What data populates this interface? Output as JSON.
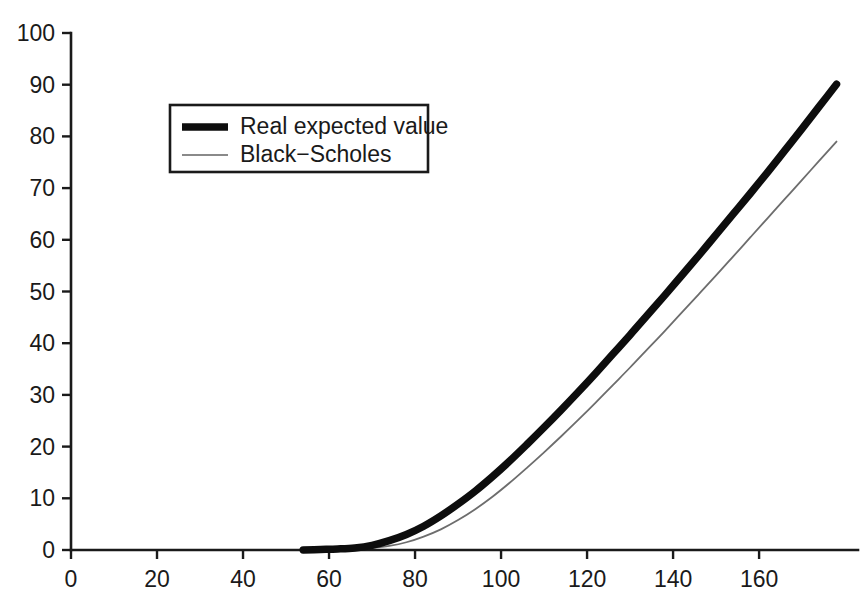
{
  "chart_data": {
    "type": "line",
    "title": "",
    "xlabel": "",
    "ylabel": "",
    "xlim": [
      0,
      183
    ],
    "ylim": [
      0,
      100
    ],
    "grid": false,
    "legend_position": "upper-left-inside",
    "xticks": [
      0,
      20,
      40,
      60,
      80,
      100,
      120,
      140,
      160
    ],
    "yticks": [
      0,
      10,
      20,
      30,
      40,
      50,
      60,
      70,
      80,
      90,
      100
    ],
    "xtick_labels": [
      "0",
      "20",
      "40",
      "60",
      "80",
      "100",
      "120",
      "140",
      "160"
    ],
    "ytick_labels": [
      "0",
      "10",
      "20",
      "30",
      "40",
      "50",
      "60",
      "70",
      "80",
      "90",
      "100"
    ],
    "series": [
      {
        "name": "Real expected value",
        "style": "thick-black",
        "color": "#0d0d0d",
        "linewidth": 7.5,
        "x": [
          54,
          58,
          62,
          66,
          70,
          74,
          78,
          82,
          86,
          90,
          94,
          98,
          102,
          106,
          110,
          114,
          118,
          122,
          126,
          130,
          134,
          138,
          142,
          146,
          150,
          154,
          158,
          162,
          166,
          170,
          174,
          178
        ],
        "y": [
          0.0,
          0.1,
          0.2,
          0.4,
          0.9,
          1.8,
          3.0,
          4.6,
          6.6,
          8.9,
          11.4,
          14.2,
          17.2,
          20.4,
          23.7,
          27.1,
          30.6,
          34.2,
          37.9,
          41.6,
          45.4,
          49.2,
          53.1,
          57.0,
          61.0,
          65.0,
          69.0,
          73.1,
          77.3,
          81.5,
          85.8,
          90.1
        ]
      },
      {
        "name": "Black−Scholes",
        "style": "thin-gray",
        "color": "#6d6d6d",
        "linewidth": 1.8,
        "x": [
          54,
          58,
          62,
          66,
          70,
          74,
          78,
          82,
          86,
          90,
          94,
          98,
          102,
          106,
          110,
          114,
          118,
          122,
          126,
          130,
          134,
          138,
          142,
          146,
          150,
          154,
          158,
          162,
          166,
          170,
          174,
          178
        ],
        "y": [
          0.0,
          0.0,
          0.05,
          0.15,
          0.4,
          0.8,
          1.5,
          2.6,
          4.0,
          5.8,
          7.9,
          10.3,
          13.0,
          15.9,
          18.9,
          22.0,
          25.2,
          28.5,
          31.9,
          35.3,
          38.8,
          42.3,
          45.9,
          49.5,
          53.1,
          56.8,
          60.5,
          64.2,
          67.9,
          71.6,
          75.3,
          79.0
        ]
      }
    ],
    "annotations": []
  },
  "legend": {
    "entries": [
      {
        "label": "Real expected value",
        "swatch": "thick-line-swatch"
      },
      {
        "label": "Black−Scholes",
        "swatch": "thin-line-swatch"
      }
    ]
  },
  "colors": {
    "background": "#ffffff",
    "axis": "#1a1a1a",
    "series_primary": "#0d0d0d",
    "series_secondary": "#6d6d6d"
  }
}
